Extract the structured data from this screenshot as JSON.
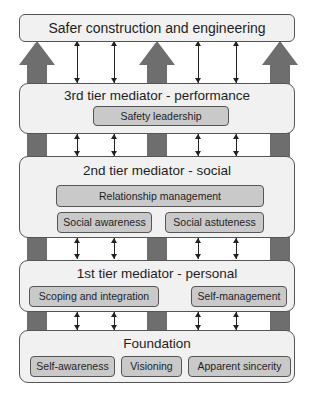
{
  "diagram": {
    "top": {
      "label": "Safer construction and engineering"
    },
    "tiers": [
      {
        "label": "3rd tier mediator - performance",
        "items": [
          "Safety leadership"
        ]
      },
      {
        "label": "2nd tier mediator - social",
        "items": [
          "Relationship management",
          "Social awareness",
          "Social astuteness"
        ]
      },
      {
        "label": "1st tier mediator - personal",
        "items": [
          "Scoping and integration",
          "Self-management"
        ]
      },
      {
        "label": "Foundation",
        "items": [
          "Self-awareness",
          "Visioning",
          "Apparent sincerity"
        ]
      }
    ],
    "colors": {
      "pillar": "#6e6e6e",
      "box_fill": "#f1f1f1",
      "chip_fill": "#c9c9c9",
      "border": "#555555"
    }
  }
}
